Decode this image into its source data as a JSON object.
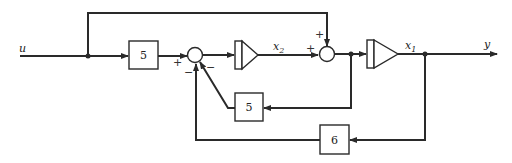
{
  "diagram": {
    "type": "block-diagram",
    "input_label": "u",
    "output_label": "y",
    "blocks": [
      {
        "id": "gain_input",
        "label": "5"
      },
      {
        "id": "gain_feedback_x2",
        "label": "5"
      },
      {
        "id": "gain_feedback_x1",
        "label": "6"
      }
    ],
    "integrators": [
      {
        "id": "integrator_1",
        "output_label": "x",
        "output_sub": "2"
      },
      {
        "id": "integrator_2",
        "output_label": "x",
        "output_sub": "1"
      }
    ],
    "summing_junctions": [
      {
        "id": "sum_1",
        "signs": {
          "left": "+",
          "bottom_left": "−",
          "bottom_right": "−"
        }
      },
      {
        "id": "sum_2",
        "signs": {
          "top": "+",
          "left": "+"
        }
      }
    ]
  }
}
